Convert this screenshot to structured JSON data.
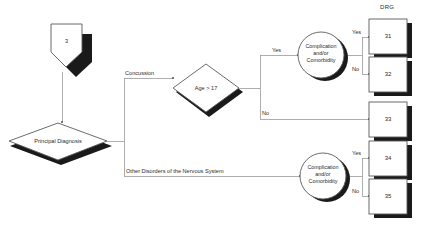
{
  "diagram": {
    "title_column": "DRG",
    "start_node": {
      "label": "3",
      "shape": "pentagon-down"
    },
    "decisions": [
      {
        "id": "principal-diagnosis",
        "label": "Principal Diagnosis",
        "shape": "diamond"
      },
      {
        "id": "age-check",
        "label": "Age > 17",
        "shape": "diamond"
      }
    ],
    "circles": [
      {
        "id": "cc-top",
        "line1": "Complication",
        "line2": "and/or",
        "line3": "Comorbidity"
      },
      {
        "id": "cc-bottom",
        "line1": "Complication",
        "line2": "and/or",
        "line3": "Comorbidity"
      }
    ],
    "edge_labels": {
      "concussion": "Concussion",
      "other_disorders": "Other Disorders of the Nervous System",
      "age_yes": "Yes",
      "age_no": "No",
      "cc_top_yes": "Yes",
      "cc_top_no": "No",
      "cc_bottom_yes": "Yes",
      "cc_bottom_no": "No"
    },
    "drg_boxes": [
      {
        "id": "drg-31",
        "label": "31"
      },
      {
        "id": "drg-32",
        "label": "32"
      },
      {
        "id": "drg-33",
        "label": "33"
      },
      {
        "id": "drg-34",
        "label": "34"
      },
      {
        "id": "drg-35",
        "label": "35"
      }
    ],
    "colors": {
      "background": "#ffffff",
      "node_stroke": "#4a4a4a",
      "connector": "#8f8f8f",
      "shadow": "#111111",
      "text": "#2b2b2b"
    }
  }
}
